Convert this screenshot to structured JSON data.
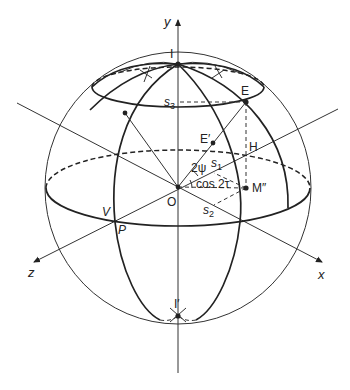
{
  "figure": {
    "axes": {
      "x_label": "x",
      "y_label": "y",
      "z_label": "z"
    },
    "points": {
      "pole_top": "I",
      "pole_bottom": "I′",
      "origin": "O",
      "point_E": "E",
      "point_E_prime": "E′",
      "point_H": "H",
      "point_M": "M″",
      "point_V": "V",
      "point_P": "P"
    },
    "labels": {
      "s1": "s",
      "s1_sub": "1",
      "s2": "s",
      "s2_sub": "2",
      "s3": "s",
      "s3_sub": "3",
      "angle_psi": "2ψ",
      "angle_tau": "cos 2τ"
    },
    "colors": {
      "stroke": "#222222",
      "background": "#ffffff"
    }
  }
}
